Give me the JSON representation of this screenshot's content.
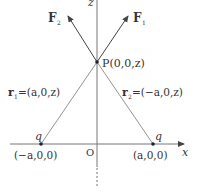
{
  "diagram": {
    "axes": {
      "x_label": "x",
      "z_label": "z",
      "origin_label": "O"
    },
    "point_P": {
      "label": "P(0,0,z)"
    },
    "charges": [
      {
        "label": "q",
        "coord": "(−a,0,0)"
      },
      {
        "label": "q",
        "coord": "(a,0,0)"
      }
    ],
    "forces": [
      {
        "label": "F",
        "sub": "1"
      },
      {
        "label": "F",
        "sub": "2"
      }
    ],
    "vectors": [
      {
        "label": "r",
        "sub": "1",
        "value": "=(a,0,z)"
      },
      {
        "label": "r",
        "sub": "2",
        "value": "=(−a,0,z)"
      }
    ],
    "colors": {
      "line": "#555555",
      "axis": "#666666",
      "text": "#333333"
    }
  }
}
